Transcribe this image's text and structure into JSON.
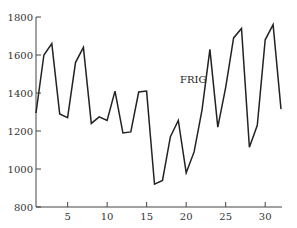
{
  "chart_data": {
    "type": "line",
    "title": "",
    "xlabel": "",
    "ylabel": "",
    "xlim": [
      1,
      32
    ],
    "ylim": [
      800,
      1800
    ],
    "xticks": [
      5,
      10,
      15,
      20,
      25,
      30
    ],
    "yticks": [
      800,
      1000,
      1200,
      1400,
      1600,
      1800
    ],
    "grid": false,
    "legend": "none",
    "annotations": [
      {
        "text": "FRIG",
        "x": 21.5,
        "y": 1390
      }
    ],
    "series": [
      {
        "name": "FRIG",
        "color": "#222222",
        "x": [
          1,
          2,
          3,
          4,
          5,
          6,
          7,
          8,
          9,
          10,
          11,
          12,
          13,
          14,
          15,
          16,
          17,
          18,
          19,
          20,
          21,
          22,
          23,
          24,
          25,
          26,
          27,
          28,
          29,
          30,
          31,
          32
        ],
        "values": [
          1295,
          1600,
          1660,
          1290,
          1270,
          1560,
          1640,
          1240,
          1275,
          1255,
          1410,
          1190,
          1195,
          1405,
          1410,
          920,
          940,
          1170,
          1255,
          980,
          1090,
          1310,
          1630,
          1220,
          1430,
          1690,
          1740,
          1115,
          1230,
          1680,
          1760,
          1315
        ]
      }
    ]
  }
}
